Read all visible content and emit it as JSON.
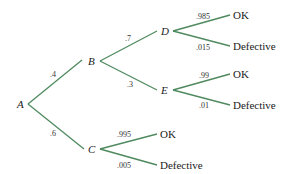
{
  "diagram": {
    "type": "probability-tree",
    "line_color": "#4f8a5f",
    "nodes": {
      "A": "A",
      "B": "B",
      "C": "C",
      "D": "D",
      "E": "E"
    },
    "branches": {
      "A_B": ".4",
      "A_C": ".6",
      "B_D": ".7",
      "B_E": ".3",
      "D_OK": ".985",
      "D_Def": ".015",
      "E_OK": ".99",
      "E_Def": ".01",
      "C_OK": ".995",
      "C_Def": ".005"
    },
    "leaves": {
      "D_OK": "OK",
      "D_Def": "Defective",
      "E_OK": "OK",
      "E_Def": "Defective",
      "C_OK": "OK",
      "C_Def": "Defective"
    }
  }
}
